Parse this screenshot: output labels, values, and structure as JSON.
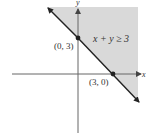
{
  "diagram": {
    "type": "inequality-graph",
    "inequality_label": "x + y ≥ 3",
    "axes": {
      "x_label": "x",
      "y_label": "y"
    },
    "points": [
      {
        "label": "(0, 3)",
        "x": 0,
        "y": 3
      },
      {
        "label": "(3, 0)",
        "x": 3,
        "y": 0
      }
    ],
    "boundary_line": "x + y = 3",
    "shaded_region": "above-right of line",
    "colors": {
      "shade": "#d9d9d9",
      "line": "#222222",
      "axis": "#555555",
      "text": "#333333"
    }
  }
}
